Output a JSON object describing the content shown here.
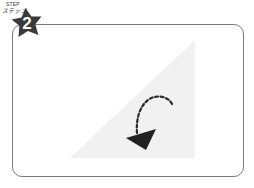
{
  "step": {
    "label_en": "STEP",
    "label_jp": "ステップ",
    "number": "2"
  },
  "colors": {
    "badge": "#3a3a3a",
    "frame_border": "#7a7a7a",
    "triangle_fill": "#f2f2f2",
    "arrow": "#2a2a2a"
  },
  "illustration": {
    "shape": "right-triangle",
    "arrow": "dashed-curved-arrow"
  }
}
